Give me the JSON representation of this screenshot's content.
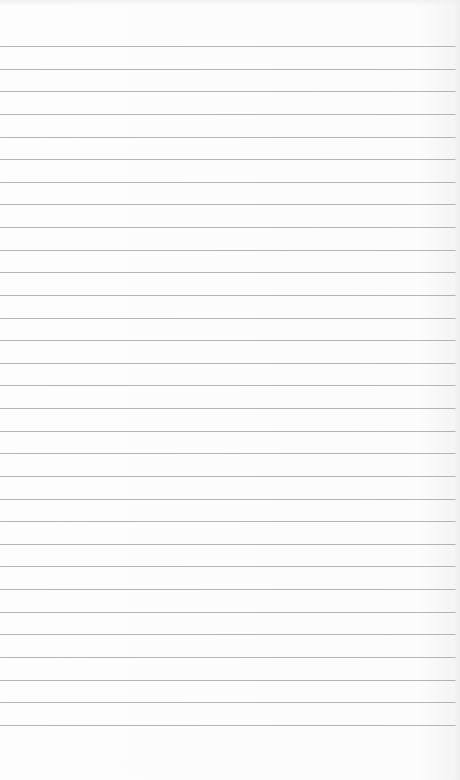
{
  "notepad": {
    "content": "",
    "line_count": 31,
    "first_line_y": 46,
    "line_spacing": 22.63,
    "line_color": "#b4b4b4",
    "paper_color": "#fcfcfc"
  }
}
